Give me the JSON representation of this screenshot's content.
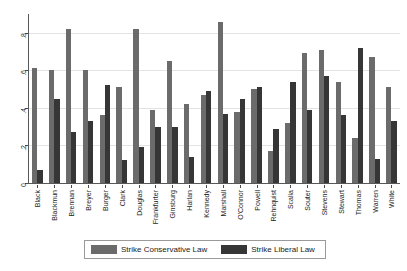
{
  "chart_data": {
    "type": "bar",
    "title": "",
    "subtitle": "",
    "xlabel": "",
    "ylabel": "",
    "ylim": [
      0,
      0.9
    ],
    "yticks": [
      "0",
      ".2",
      ".4",
      ".6",
      ".8"
    ],
    "ytick_values": [
      0,
      0.2,
      0.4,
      0.6,
      0.8
    ],
    "grid": true,
    "legend_position": "bottom",
    "categories": [
      "Black",
      "Blackmun",
      "Brennan",
      "Breyer",
      "Burger",
      "Clark",
      "Douglas",
      "Frankfurter",
      "Ginsburg",
      "Harlan",
      "Kennedy",
      "Marshall",
      "O'Connor",
      "Powell",
      "Rehnquist",
      "Scalia",
      "Souter",
      "Stevens",
      "Stewart",
      "Thomas",
      "Warren",
      "White"
    ],
    "series": [
      {
        "name": "Strike Conservative Law",
        "color": "#6b6b6b",
        "values": [
          0.61,
          0.6,
          0.82,
          0.6,
          0.36,
          0.51,
          0.82,
          0.39,
          0.65,
          0.42,
          0.47,
          0.86,
          0.38,
          0.5,
          0.17,
          0.32,
          0.69,
          0.71,
          0.54,
          0.24,
          0.67,
          0.51
        ]
      },
      {
        "name": "Strike Liberal Law",
        "color": "#363636",
        "values": [
          0.07,
          0.45,
          0.27,
          0.33,
          0.52,
          0.12,
          0.19,
          0.3,
          0.3,
          0.14,
          0.49,
          0.37,
          0.45,
          0.51,
          0.29,
          0.54,
          0.39,
          0.57,
          0.36,
          0.72,
          0.13,
          0.33
        ]
      }
    ]
  },
  "legend": {
    "items": [
      {
        "label": "Strike Conservative Law",
        "color": "#6b6b6b"
      },
      {
        "label": "Strike Liberal Law",
        "color": "#363636"
      }
    ]
  },
  "colors": {
    "conservative": "#6b6b6b",
    "liberal": "#363636",
    "gridline": "#e3e3e3",
    "axis": "#585858",
    "background": "#ffffff"
  }
}
